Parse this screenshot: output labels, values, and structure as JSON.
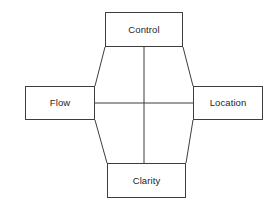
{
  "diagram": {
    "title": "",
    "background_color": "#ffffff",
    "line_color": "#3d3d3d",
    "text_color": "#252525",
    "layout": "diamond",
    "nodes": [
      {
        "id": "control",
        "label": "Control",
        "position": "top",
        "x": 105,
        "y": 12,
        "width": 78,
        "height": 35
      },
      {
        "id": "flow",
        "label": "Flow",
        "position": "left",
        "x": 25,
        "y": 86,
        "width": 70,
        "height": 34
      },
      {
        "id": "location",
        "label": "Location",
        "position": "right",
        "x": 193,
        "y": 86,
        "width": 70,
        "height": 34
      },
      {
        "id": "clarity",
        "label": "Clarity",
        "position": "bottom",
        "x": 107,
        "y": 163,
        "width": 79,
        "height": 35
      }
    ],
    "edges": [
      {
        "id": "control-flow",
        "from": "control",
        "to": "flow",
        "style": "diagonal"
      },
      {
        "id": "control-location",
        "from": "control",
        "to": "location",
        "style": "diagonal"
      },
      {
        "id": "flow-clarity",
        "from": "flow",
        "to": "clarity",
        "style": "diagonal"
      },
      {
        "id": "location-clarity",
        "from": "location",
        "to": "clarity",
        "style": "diagonal"
      },
      {
        "id": "flow-location",
        "from": "flow",
        "to": "location",
        "style": "horizontal"
      },
      {
        "id": "control-clarity",
        "from": "control",
        "to": "clarity",
        "style": "vertical"
      }
    ]
  }
}
